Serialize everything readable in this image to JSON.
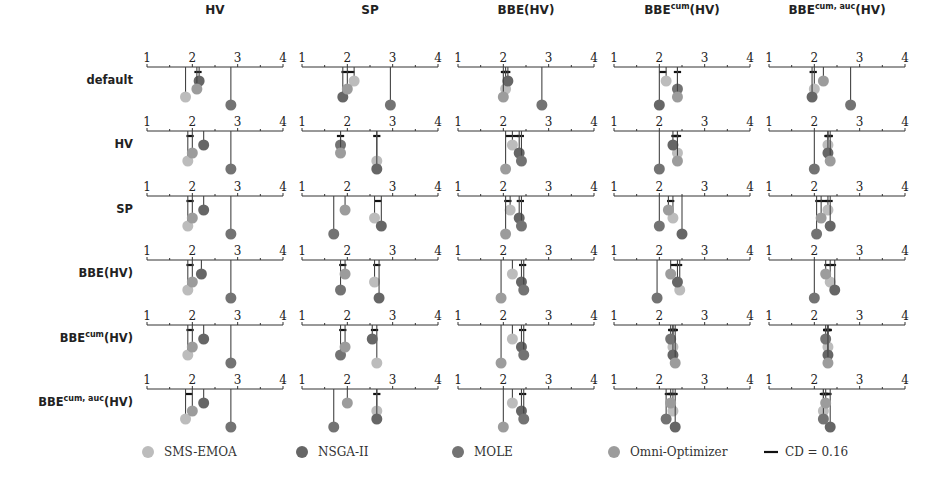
{
  "chart_data": {
    "type": "critical-difference",
    "title": "",
    "axis_range": [
      1,
      4
    ],
    "axis_ticks": [
      1,
      2,
      3,
      4
    ],
    "columns": [
      "HV",
      "SP",
      "BBE(HV)",
      "BBE^cum(HV)",
      "BBE^cum,auc(HV)"
    ],
    "column_labels": [
      {
        "base": "HV",
        "sup": "",
        "tail": ""
      },
      {
        "base": "SP",
        "sup": "",
        "tail": ""
      },
      {
        "base": "BBE(HV)",
        "sup": "",
        "tail": ""
      },
      {
        "base": "BBE",
        "sup": "cum",
        "tail": "(HV)"
      },
      {
        "base": "BBE",
        "sup": "cum, auc",
        "tail": "(HV)"
      }
    ],
    "rows": [
      "default",
      "HV",
      "SP",
      "BBE(HV)",
      "BBE^cum(HV)",
      "BBE^cum,auc(HV)"
    ],
    "row_labels": [
      {
        "base": "default",
        "sup": "",
        "tail": ""
      },
      {
        "base": "HV",
        "sup": "",
        "tail": ""
      },
      {
        "base": "SP",
        "sup": "",
        "tail": ""
      },
      {
        "base": "BBE(HV)",
        "sup": "",
        "tail": ""
      },
      {
        "base": "BBE",
        "sup": "cum",
        "tail": "(HV)"
      },
      {
        "base": "BBE",
        "sup": "cum, auc",
        "tail": "(HV)"
      }
    ],
    "series": [
      {
        "name": "SMS-EMOA",
        "color": "#bcbcbc"
      },
      {
        "name": "NSGA-II",
        "color": "#666666"
      },
      {
        "name": "MOLE",
        "color": "#737373"
      },
      {
        "name": "Omni-Optimizer",
        "color": "#9c9c9c"
      }
    ],
    "cd_value": 0.16,
    "legend_position": "bottom",
    "grid": false,
    "mean_ranks": [
      [
        {
          "SMS-EMOA": 1.85,
          "NSGA-II": 2.15,
          "MOLE": 2.85,
          "Omni-Optimizer": 2.1
        },
        {
          "SMS-EMOA": 2.15,
          "NSGA-II": 1.9,
          "MOLE": 2.95,
          "Omni-Optimizer": 2.0
        },
        {
          "SMS-EMOA": 2.05,
          "NSGA-II": 2.1,
          "MOLE": 2.85,
          "Omni-Optimizer": 2.0
        },
        {
          "SMS-EMOA": 2.15,
          "NSGA-II": 2.0,
          "MOLE": 2.4,
          "Omni-Optimizer": 2.4
        },
        {
          "SMS-EMOA": 2.0,
          "NSGA-II": 1.95,
          "MOLE": 2.8,
          "Omni-Optimizer": 2.2
        }
      ],
      [
        {
          "SMS-EMOA": 1.9,
          "NSGA-II": 2.25,
          "MOLE": 2.85,
          "Omni-Optimizer": 2.0
        },
        {
          "SMS-EMOA": 2.65,
          "NSGA-II": 2.65,
          "MOLE": 1.85,
          "Omni-Optimizer": 1.85
        },
        {
          "SMS-EMOA": 2.2,
          "NSGA-II": 2.35,
          "MOLE": 2.4,
          "Omni-Optimizer": 2.05
        },
        {
          "SMS-EMOA": 2.4,
          "NSGA-II": 2.3,
          "MOLE": 2.0,
          "Omni-Optimizer": 2.4
        },
        {
          "SMS-EMOA": 2.3,
          "NSGA-II": 2.3,
          "MOLE": 2.0,
          "Omni-Optimizer": 2.35
        }
      ],
      [
        {
          "SMS-EMOA": 1.9,
          "NSGA-II": 2.25,
          "MOLE": 2.85,
          "Omni-Optimizer": 2.0
        },
        {
          "SMS-EMOA": 2.6,
          "NSGA-II": 2.75,
          "MOLE": 1.7,
          "Omni-Optimizer": 1.95
        },
        {
          "SMS-EMOA": 2.15,
          "NSGA-II": 2.35,
          "MOLE": 2.4,
          "Omni-Optimizer": 2.05
        },
        {
          "SMS-EMOA": 2.3,
          "NSGA-II": 2.5,
          "MOLE": 2.0,
          "Omni-Optimizer": 2.2
        },
        {
          "SMS-EMOA": 2.3,
          "NSGA-II": 2.35,
          "MOLE": 2.05,
          "Omni-Optimizer": 2.15
        }
      ],
      [
        {
          "SMS-EMOA": 1.9,
          "NSGA-II": 2.2,
          "MOLE": 2.85,
          "Omni-Optimizer": 2.0
        },
        {
          "SMS-EMOA": 2.6,
          "NSGA-II": 2.7,
          "MOLE": 1.85,
          "Omni-Optimizer": 1.95
        },
        {
          "SMS-EMOA": 2.2,
          "NSGA-II": 2.4,
          "MOLE": 2.45,
          "Omni-Optimizer": 1.95
        },
        {
          "SMS-EMOA": 2.45,
          "NSGA-II": 2.4,
          "MOLE": 1.95,
          "Omni-Optimizer": 2.25
        },
        {
          "SMS-EMOA": 2.35,
          "NSGA-II": 2.45,
          "MOLE": 2.0,
          "Omni-Optimizer": 2.25
        }
      ],
      [
        {
          "SMS-EMOA": 1.9,
          "NSGA-II": 2.25,
          "MOLE": 2.85,
          "Omni-Optimizer": 2.0
        },
        {
          "SMS-EMOA": 2.65,
          "NSGA-II": 2.55,
          "MOLE": 1.85,
          "Omni-Optimizer": 1.95
        },
        {
          "SMS-EMOA": 2.2,
          "NSGA-II": 2.4,
          "MOLE": 2.45,
          "Omni-Optimizer": 1.95
        },
        {
          "SMS-EMOA": 2.3,
          "NSGA-II": 2.3,
          "MOLE": 2.25,
          "Omni-Optimizer": 2.35
        },
        {
          "SMS-EMOA": 2.3,
          "NSGA-II": 2.3,
          "MOLE": 2.25,
          "Omni-Optimizer": 2.3
        }
      ],
      [
        {
          "SMS-EMOA": 1.85,
          "NSGA-II": 2.25,
          "MOLE": 2.85,
          "Omni-Optimizer": 2.0
        },
        {
          "SMS-EMOA": 2.65,
          "NSGA-II": 2.65,
          "MOLE": 1.7,
          "Omni-Optimizer": 2.0
        },
        {
          "SMS-EMOA": 2.2,
          "NSGA-II": 2.4,
          "MOLE": 2.45,
          "Omni-Optimizer": 2.0
        },
        {
          "SMS-EMOA": 2.3,
          "NSGA-II": 2.35,
          "MOLE": 2.15,
          "Omni-Optimizer": 2.25
        },
        {
          "SMS-EMOA": 2.2,
          "NSGA-II": 2.35,
          "MOLE": 2.2,
          "Omni-Optimizer": 2.25
        }
      ]
    ]
  },
  "legend": {
    "items": [
      {
        "label": "SMS-EMOA",
        "color": "#bcbcbc"
      },
      {
        "label": "NSGA-II",
        "color": "#666666"
      },
      {
        "label": "MOLE",
        "color": "#737373"
      },
      {
        "label": "Omni-Optimizer",
        "color": "#9c9c9c"
      }
    ],
    "cd_label": "CD = 0.16"
  }
}
